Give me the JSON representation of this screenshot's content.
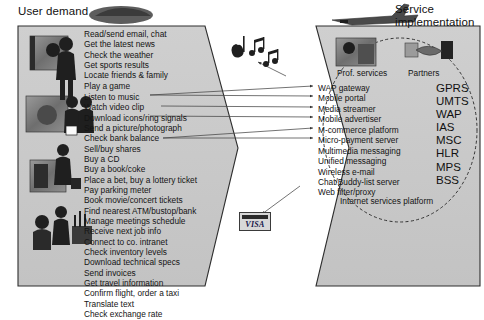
{
  "diagram": {
    "title_left": "User demand",
    "title_right": "Service\nimplementation",
    "background": "#ffffff",
    "panel_fill": "#c9c9c9",
    "panel_stroke": "#2e2e2e"
  },
  "user_demand": {
    "group_1": [
      "Read/send email, chat",
      "Get the latest news",
      "Check the weather",
      "Get sports results",
      "Locate friends & family",
      "Play a game"
    ],
    "group_2": [
      "Listen to music",
      "Watch video clip",
      "Download icons/ring signals",
      "Send a picture/photograph",
      "Check bank balance",
      "Sell/buy shares"
    ],
    "group_3": [
      "Buy a CD",
      "Buy a book/coke",
      "Place a bet, buy a lottery ticket",
      "Pay parking meter",
      "Book movie/concert tickets",
      "Find nearest ATM/bustop/bank",
      "Manage meetings schedule",
      "Receive next job info",
      "Connect to co. intranet",
      "Check inventory levels",
      "Download technical specs",
      "Send invoices",
      "Get travel information",
      "Confirm flight, order a taxi",
      "Translate text",
      "Check exchange rate"
    ]
  },
  "service_implementation": {
    "prof_services_label": "Prof. services",
    "partners_label": "Partners",
    "platform_label": "Internet services platform",
    "services": [
      "WAP gateway",
      "Mobile portal",
      "Media streamer",
      "Mobile advertiser",
      "M-commerce platform",
      "Micro-payment server",
      "Multimedia messaging",
      "Unified messaging",
      "Wireless e-mail",
      "Chat/Buddy-list server",
      "Web filter/proxy"
    ],
    "acronyms": [
      "GPRS",
      "UMTS",
      "WAP",
      "IAS",
      "MSC",
      "HLR",
      "MPS",
      "BSS"
    ]
  },
  "graphics": {
    "visa_card_label": "VISA",
    "music_notes_icon": "music-notes-icon",
    "airplane_icon": "airplane-icon",
    "car_icon": "car-icon"
  }
}
